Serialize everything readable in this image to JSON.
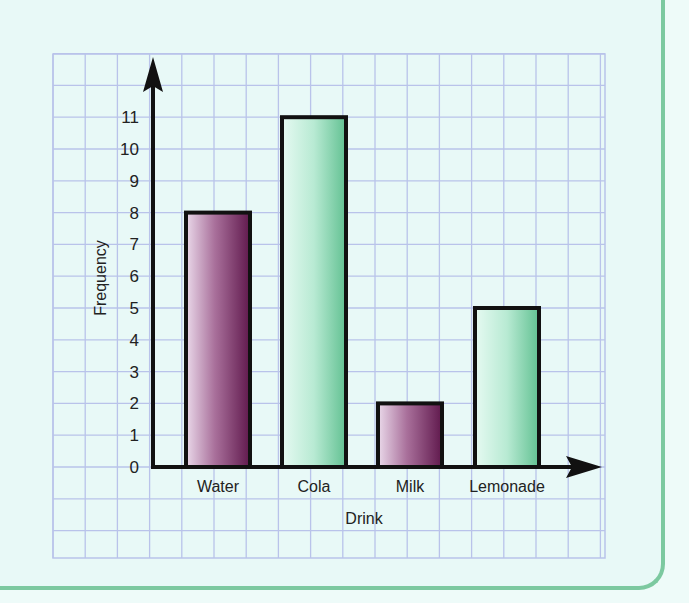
{
  "chart_data": {
    "type": "bar",
    "title": "",
    "xlabel": "Drink",
    "ylabel": "Frequency",
    "categories": [
      "Water",
      "Cola",
      "Milk",
      "Lemonade"
    ],
    "values": [
      8,
      11,
      2,
      5
    ],
    "bar_colors": [
      "purple-gradient",
      "green-gradient",
      "purple-gradient",
      "green-gradient"
    ],
    "yticks": [
      0,
      1,
      2,
      3,
      4,
      5,
      6,
      7,
      8,
      9,
      10,
      11
    ],
    "ylim": [
      0,
      12
    ],
    "grid": true,
    "legend": null
  },
  "colors": {
    "background": "#e8f9f7",
    "grid": "#b9c3ea",
    "panel_border": "#7cc9a0",
    "axis": "#111111",
    "purple_light": "#e6d3e6",
    "purple_dark": "#6b2457",
    "green_light": "#e4f8ef",
    "green_dark": "#6cc49a"
  }
}
